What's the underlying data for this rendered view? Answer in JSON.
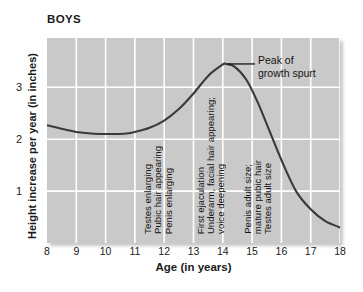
{
  "chart_data": {
    "type": "line",
    "title": "BOYS",
    "xlabel": "Age (in years)",
    "ylabel": "Height increase per year (in inches)",
    "xlim": [
      8,
      18
    ],
    "ylim": [
      0,
      3.95
    ],
    "grid": true,
    "legend": "none",
    "xticks": [
      "8",
      "9",
      "10",
      "11",
      "12",
      "13",
      "14",
      "15",
      "16",
      "17",
      "18"
    ],
    "xtick_values": [
      8,
      9,
      10,
      11,
      12,
      13,
      14,
      15,
      16,
      17,
      18
    ],
    "yticks": [
      "1",
      "2",
      "3"
    ],
    "ytick_values": [
      1,
      2,
      3
    ],
    "series": [
      {
        "name": "Height increase per year",
        "x": [
          8.0,
          8.5,
          9.0,
          9.5,
          10.0,
          10.3,
          10.7,
          11.0,
          11.5,
          12.0,
          12.5,
          13.0,
          13.5,
          14.0,
          14.1,
          14.4,
          14.8,
          15.2,
          15.6,
          16.0,
          16.5,
          17.0,
          17.5,
          18.0
        ],
        "y": [
          2.27,
          2.2,
          2.14,
          2.11,
          2.1,
          2.1,
          2.11,
          2.14,
          2.22,
          2.36,
          2.58,
          2.88,
          3.22,
          3.44,
          3.45,
          3.4,
          3.15,
          2.7,
          2.15,
          1.6,
          1.0,
          0.65,
          0.42,
          0.3
        ]
      }
    ],
    "annotations": [
      {
        "name": "peak-callout",
        "text_line1": "Peak of",
        "text_line2": "growth spurt",
        "points_to_x": 14.1,
        "points_to_y": 3.45
      },
      {
        "name": "milestone-testes-enlarging",
        "text": "Testes enlarging",
        "x": 11.45
      },
      {
        "name": "milestone-pubic-hair-appearing",
        "text": "Pubic hair appearing",
        "x": 11.8
      },
      {
        "name": "milestone-penis-enlarging",
        "text": "Penis enlarging",
        "x": 12.15
      },
      {
        "name": "milestone-first-ejaculation",
        "text": "First ejaculation",
        "x": 13.25
      },
      {
        "name": "milestone-underarm-facial-hair",
        "text": "Underarm, facial hair appearing;",
        "x": 13.6
      },
      {
        "name": "milestone-voice-deepening",
        "text": "voice deepening",
        "x": 13.95
      },
      {
        "name": "milestone-penis-adult-size",
        "text": "Penis adult size;",
        "x": 14.85
      },
      {
        "name": "milestone-mature-pubic-hair",
        "text": "mature pubic hair",
        "x": 15.2
      },
      {
        "name": "milestone-testes-adult-size",
        "text": "Testes adult size",
        "x": 15.55
      }
    ],
    "colors": {
      "plot_background": "#c9c9c9",
      "gridline": "#ffffff",
      "curve": "#3a3a3a",
      "text": "#141414",
      "page_background": "#ffffff"
    }
  }
}
